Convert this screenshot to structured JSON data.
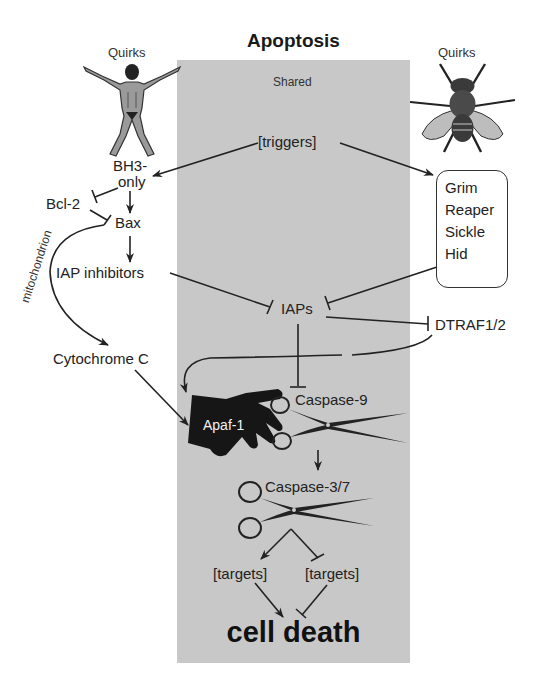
{
  "title": "Apoptosis",
  "panel": {
    "label": "Shared",
    "color": "#c8c8c8"
  },
  "left": {
    "organism_label": "Quirks",
    "organism_icon": "human-figure",
    "nodes": {
      "bh3_line1": "BH3-",
      "bh3_line2": "only",
      "bcl2": "Bcl-2",
      "bax": "Bax",
      "iap_inhibitors": "IAP inhibitors",
      "mitochondrion": "mitochondrion",
      "cytochrome_c": "Cytochrome C"
    }
  },
  "right": {
    "organism_label": "Quirks",
    "organism_icon": "fly-figure",
    "box_items": [
      "Grim",
      "Reaper",
      "Sickle",
      "Hid"
    ],
    "dtraf": "DTRAF1/2"
  },
  "center": {
    "triggers": "[triggers]",
    "iaps": "IAPs",
    "apaf1": "Apaf-1",
    "caspase9": "Caspase-9",
    "caspase37": "Caspase-3/7",
    "targets_left": "[targets]",
    "targets_right": "[targets]",
    "outcome": "cell death"
  }
}
